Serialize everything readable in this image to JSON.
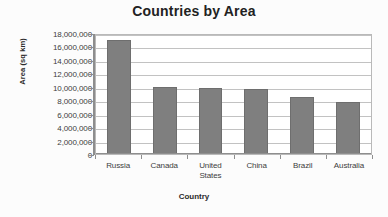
{
  "chart_data": {
    "type": "bar",
    "title": "Countries by Area",
    "xlabel": "Country",
    "ylabel": "Area (sq km)",
    "categories": [
      "Russia",
      "Canada",
      "United States",
      "China",
      "Brazil",
      "Australia"
    ],
    "values": [
      17000000,
      10000000,
      9800000,
      9700000,
      8500000,
      7800000
    ],
    "series": [
      {
        "name": "Area",
        "values": [
          17000000,
          10000000,
          9800000,
          9700000,
          8500000,
          7800000
        ]
      }
    ],
    "ylim": [
      0,
      18000000
    ],
    "ytick_values": [
      0,
      2000000,
      4000000,
      6000000,
      8000000,
      10000000,
      12000000,
      14000000,
      16000000,
      18000000
    ],
    "ytick_labels": [
      "18,000,000",
      "16,000,000",
      "14,000,000",
      "12,000,000",
      "10,000,000",
      "8,000,000",
      "6,000,000",
      "4,000,000",
      "2,000,000",
      "0"
    ],
    "grid": true,
    "legend": false,
    "legend_position": "none",
    "bar_color": "#7f7f7f",
    "plot_background": "#ffffff",
    "gridline_color": "#c2c2c2"
  }
}
